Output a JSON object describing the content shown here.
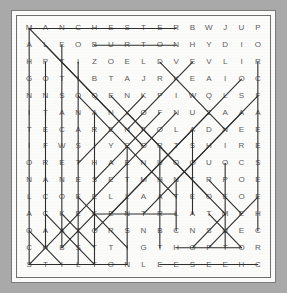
{
  "puzzle": {
    "type": "word-search",
    "rows": 15,
    "cols": 15,
    "grid": [
      [
        "M",
        "A",
        "N",
        "C",
        "H",
        "E",
        "S",
        "T",
        "E",
        "R",
        "B",
        "W",
        "J",
        "U",
        "P"
      ],
      [
        "A",
        "L",
        "E",
        "O",
        "B",
        "U",
        "R",
        "T",
        "O",
        "N",
        "H",
        "Y",
        "D",
        "I",
        "O"
      ],
      [
        "H",
        "P",
        "T",
        "I",
        "Z",
        "O",
        "E",
        "L",
        "D",
        "V",
        "E",
        "V",
        "L",
        "I",
        "R"
      ],
      [
        "G",
        "O",
        "T",
        "I",
        "B",
        "T",
        "A",
        "J",
        "R",
        "K",
        "E",
        "A",
        "I",
        "O",
        "C"
      ],
      [
        "N",
        "N",
        "S",
        "O",
        "Q",
        "E",
        "N",
        "K",
        "P",
        "I",
        "W",
        "Q",
        "L",
        "S",
        "F"
      ],
      [
        "I",
        "T",
        "A",
        "N",
        "A",
        "N",
        "Y",
        "O",
        "F",
        "N",
        "U",
        "Z",
        "A",
        "A",
        "A"
      ],
      [
        "T",
        "E",
        "C",
        "A",
        "R",
        "E",
        "N",
        "F",
        "O",
        "L",
        "A",
        "D",
        "N",
        "E",
        "E"
      ],
      [
        "I",
        "F",
        "W",
        "S",
        "I",
        "Y",
        "E",
        "O",
        "R",
        "T",
        "S",
        "H",
        "I",
        "R",
        "E"
      ],
      [
        "O",
        "R",
        "E",
        "T",
        "H",
        "A",
        "E",
        "N",
        "U",
        "O",
        "O",
        "U",
        "O",
        "C",
        "S"
      ],
      [
        "N",
        "A",
        "N",
        "E",
        "S",
        "E",
        "T",
        "M",
        "H",
        "N",
        "T",
        "R",
        "P",
        "O",
        "E"
      ],
      [
        "L",
        "C",
        "O",
        "E",
        "E",
        "L",
        "L",
        "A",
        "A",
        "T",
        "E",
        "O",
        "E",
        "O",
        "E"
      ],
      [
        "A",
        "C",
        "K",
        "E",
        "K",
        "E",
        "N",
        "T",
        "R",
        "L",
        "A",
        "T",
        "M",
        "E",
        "H"
      ],
      [
        "O",
        "A",
        "A",
        "Z",
        "O",
        "R",
        "S",
        "N",
        "B",
        "C",
        "N",
        "S",
        "U",
        "E",
        "C"
      ],
      [
        "C",
        "H",
        "B",
        "S",
        "T",
        "T",
        "I",
        "G",
        "T",
        "H",
        "O",
        "P",
        "T",
        "O",
        "R"
      ],
      [
        "S",
        "T",
        "I",
        "L",
        "T",
        "O",
        "N",
        "L",
        "E",
        "E",
        "S",
        "E",
        "E",
        "H",
        "C"
      ]
    ],
    "strikes": [
      {
        "name": "manchester",
        "x1": 0.5,
        "y1": 0.5,
        "x2": 9.5,
        "y2": 0.5
      },
      {
        "name": "burton",
        "x1": 4.5,
        "y1": 1.5,
        "x2": 9.5,
        "y2": 1.5
      },
      {
        "name": "kent",
        "x1": 4.5,
        "y1": 11.5,
        "x2": 9.5,
        "y2": 11.5
      },
      {
        "name": "hop",
        "x1": 9.5,
        "y1": 13.5,
        "x2": 13.5,
        "y2": 13.5
      },
      {
        "name": "stilton",
        "x1": 0.5,
        "y1": 14.5,
        "x2": 6.5,
        "y2": 14.5
      },
      {
        "name": "cheese-reversed",
        "x1": 14.5,
        "y1": 14.5,
        "x2": 8.5,
        "y2": 14.5
      },
      {
        "name": "vertical-col0",
        "x1": 0.5,
        "y1": 0.5,
        "x2": 0.5,
        "y2": 14.5
      },
      {
        "name": "vertical-col1",
        "x1": 1.5,
        "y1": 2.5,
        "x2": 1.5,
        "y2": 13.5
      },
      {
        "name": "vertical-col2",
        "x1": 2.5,
        "y1": 1.5,
        "x2": 2.5,
        "y2": 13.5
      },
      {
        "name": "vertical-col3",
        "x1": 3.5,
        "y1": 2.5,
        "x2": 3.5,
        "y2": 14.5
      },
      {
        "name": "vertical-col4",
        "x1": 4.5,
        "y1": 5.5,
        "x2": 4.5,
        "y2": 14.5
      },
      {
        "name": "vertical-col6",
        "x1": 6.5,
        "y1": 7.5,
        "x2": 6.5,
        "y2": 14.5
      },
      {
        "name": "vertical-col8",
        "x1": 8.5,
        "y1": 7.5,
        "x2": 8.5,
        "y2": 13.5
      },
      {
        "name": "vertical-col9",
        "x1": 9.5,
        "y1": 9.5,
        "x2": 9.5,
        "y2": 12.5
      },
      {
        "name": "vertical-col10",
        "x1": 10.5,
        "y1": 6.5,
        "x2": 10.5,
        "y2": 11.5
      },
      {
        "name": "vertical-col12",
        "x1": 12.5,
        "y1": 8.5,
        "x2": 12.5,
        "y2": 13.5
      },
      {
        "name": "vertical-col14",
        "x1": 14.5,
        "y1": 2.5,
        "x2": 14.5,
        "y2": 12.5
      },
      {
        "name": "diag-dr-1",
        "x1": 0.5,
        "y1": 0.5,
        "x2": 7.5,
        "y2": 7.5
      },
      {
        "name": "diag-dr-2",
        "x1": 1.5,
        "y1": 1.5,
        "x2": 5.5,
        "y2": 5.5
      },
      {
        "name": "diag-dr-3",
        "x1": 3.5,
        "y1": 4.5,
        "x2": 9.5,
        "y2": 10.5
      },
      {
        "name": "diag-dr-4",
        "x1": 5.5,
        "y1": 4.5,
        "x2": 11.5,
        "y2": 10.5
      },
      {
        "name": "diag-dr-5",
        "x1": 6.5,
        "y1": 5.5,
        "x2": 12.5,
        "y2": 11.5
      },
      {
        "name": "diag-dr-6",
        "x1": 3.5,
        "y1": 10.5,
        "x2": 6.5,
        "y2": 13.5
      },
      {
        "name": "diag-dr-7",
        "x1": 1.5,
        "y1": 11.5,
        "x2": 4.5,
        "y2": 14.5
      },
      {
        "name": "diag-dr-8",
        "x1": 11.5,
        "y1": 9.5,
        "x2": 13.5,
        "y2": 11.5
      },
      {
        "name": "diag-dr-9",
        "x1": 0.5,
        "y1": 12.5,
        "x2": 2.5,
        "y2": 14.5
      },
      {
        "name": "diag-ur-1",
        "x1": 0.5,
        "y1": 14.5,
        "x2": 9.5,
        "y2": 5.5
      },
      {
        "name": "diag-ur-2",
        "x1": 4.5,
        "y1": 12.5,
        "x2": 11.5,
        "y2": 5.5
      },
      {
        "name": "diag-ur-3",
        "x1": 5.5,
        "y1": 11.5,
        "x2": 13.5,
        "y2": 3.5
      },
      {
        "name": "diag-ur-4",
        "x1": 7.5,
        "y1": 11.5,
        "x2": 14.5,
        "y2": 4.5
      },
      {
        "name": "diag-ur-5",
        "x1": 6.5,
        "y1": 6.5,
        "x2": 10.5,
        "y2": 2.5
      },
      {
        "name": "diag-ur-6",
        "x1": 4.5,
        "y1": 9.5,
        "x2": 8.5,
        "y2": 5.5
      },
      {
        "name": "diag-ur-7",
        "x1": 3.5,
        "y1": 8.5,
        "x2": 7.5,
        "y2": 4.5
      },
      {
        "name": "diag-ur-8",
        "x1": 9.5,
        "y1": 9.5,
        "x2": 13.5,
        "y2": 5.5
      },
      {
        "name": "diag-ur-9",
        "x1": 11.5,
        "y1": 13.5,
        "x2": 14.5,
        "y2": 10.5
      },
      {
        "name": "diag-ur-10",
        "x1": 10.5,
        "y1": 13.5,
        "x2": 12.5,
        "y2": 11.5
      },
      {
        "name": "diag-dr-10",
        "x1": 11.5,
        "y1": 11.5,
        "x2": 13.5,
        "y2": 13.5
      },
      {
        "name": "diag-dr-11",
        "x1": 8.5,
        "y1": 2.5,
        "x2": 12.5,
        "y2": 6.5
      },
      {
        "name": "diag-ur-11",
        "x1": 2.5,
        "y1": 13.5,
        "x2": 4.5,
        "y2": 11.5
      },
      {
        "name": "diag-dr-12",
        "x1": 2.5,
        "y1": 11.5,
        "x2": 4.5,
        "y2": 13.5
      }
    ]
  },
  "colors": {
    "background": "#a9a9a9",
    "paper": "#fbfbfa",
    "letter": "#5c5c5c",
    "strike": "#2e2e2e",
    "frame": "#6f6f6f"
  }
}
